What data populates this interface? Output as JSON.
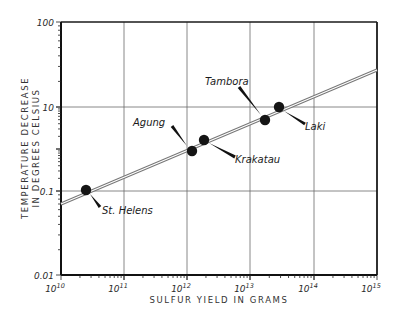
{
  "chart_data": {
    "type": "scatter",
    "title": "",
    "xlabel": "SULFUR YIELD IN GRAMS",
    "ylabel_line1": "TEMPERATURE DECREASE",
    "ylabel_line2": "IN DEGREES CELSIUS",
    "xscale": "log",
    "yscale": "log",
    "xlim": [
      10000000000.0,
      1000000000000000.0
    ],
    "x_tick_labels": [
      {
        "base": "10",
        "exp": "10"
      },
      {
        "base": "10",
        "exp": "11"
      },
      {
        "base": "10",
        "exp": "12"
      },
      {
        "base": "10",
        "exp": "13"
      },
      {
        "base": "10",
        "exp": "14"
      },
      {
        "base": "10",
        "exp": "15"
      }
    ],
    "y_tick_labels": [
      "100",
      "10",
      "0.1",
      "0.01"
    ],
    "grid": true,
    "legend": null,
    "series": [
      {
        "name": "Volcanic eruptions",
        "points": [
          {
            "label": "St. Helens",
            "x": 25000000000.0,
            "y": 0.1
          },
          {
            "label": "Agung",
            "x": 1300000000000.0,
            "y": 3
          },
          {
            "label": "Krakatau",
            "x": 2000000000000.0,
            "y": 4
          },
          {
            "label": "Tambora",
            "x": 18000000000000.0,
            "y": 7
          },
          {
            "label": "Laki",
            "x": 30000000000000.0,
            "y": 10
          }
        ]
      },
      {
        "name": "Trend line",
        "type": "line",
        "points": [
          {
            "x": 10000000000.0,
            "y": 0.07
          },
          {
            "x": 1000000000000000.0,
            "y": 27
          }
        ]
      }
    ]
  },
  "layout": {
    "plot": {
      "left": 61,
      "top": 22,
      "right": 377,
      "bottom": 275
    },
    "x_grid_px": [
      61,
      124,
      187,
      250,
      314,
      377
    ],
    "y_grid_px": [
      {
        "label": "100",
        "y": 22
      },
      {
        "label": "10",
        "y": 107
      },
      {
        "label": "0.1",
        "y": 191
      },
      {
        "label": "0.01",
        "y": 275
      }
    ],
    "trend_px": {
      "x1": 61,
      "y1": 204,
      "x2": 377,
      "y2": 70
    },
    "markers": [
      {
        "label": "St. Helens",
        "cx": 86,
        "cy": 190,
        "leader": [
          90,
          194,
          100,
          207
        ],
        "tx": 102,
        "ty": 214
      },
      {
        "label": "Agung",
        "cx": 192,
        "cy": 151,
        "leader": [
          187,
          146,
          172,
          126
        ],
        "tx": 133,
        "ty": 126
      },
      {
        "label": "Krakatau",
        "cx": 204,
        "cy": 140,
        "leader": [
          209,
          143,
          235,
          157
        ],
        "tx": 235,
        "ty": 163
      },
      {
        "label": "Tambora",
        "cx": 265,
        "cy": 120,
        "leader": [
          261,
          115,
          239,
          87
        ],
        "tx": 205,
        "ty": 85
      },
      {
        "label": "Laki",
        "cx": 279,
        "cy": 107,
        "leader": [
          284,
          111,
          305,
          124
        ],
        "tx": 305,
        "ty": 130
      }
    ]
  }
}
